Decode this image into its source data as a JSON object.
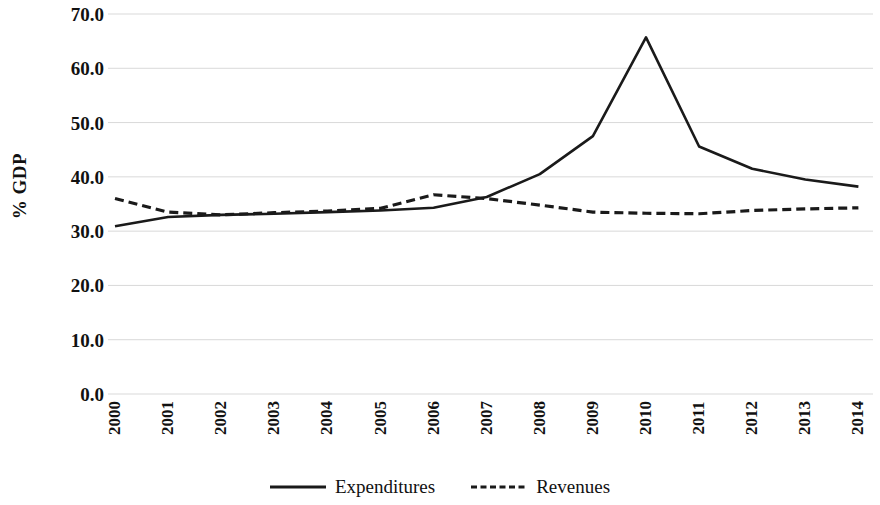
{
  "chart_data": {
    "type": "line",
    "title": "",
    "xlabel": "",
    "ylabel": "% GDP",
    "categories": [
      "2000",
      "2001",
      "2002",
      "2003",
      "2004",
      "2005",
      "2006",
      "2007",
      "2008",
      "2009",
      "2010",
      "2011",
      "2012",
      "2013",
      "2014"
    ],
    "series": [
      {
        "name": "Expenditures",
        "style": "solid",
        "color": "#1a1a1a",
        "values": [
          30.9,
          32.6,
          33.0,
          33.2,
          33.5,
          33.8,
          34.3,
          36.3,
          40.5,
          47.5,
          65.7,
          45.6,
          41.5,
          39.5,
          38.2
        ]
      },
      {
        "name": "Revenues",
        "style": "dashed",
        "color": "#1a1a1a",
        "values": [
          36.0,
          33.5,
          33.0,
          33.4,
          33.7,
          34.2,
          36.7,
          36.0,
          34.8,
          33.5,
          33.3,
          33.2,
          33.8,
          34.1,
          34.3
        ]
      }
    ],
    "ylim": [
      0,
      70
    ],
    "ytick_values": [
      70.0,
      60.0,
      50.0,
      40.0,
      30.0,
      20.0,
      10.0,
      0.0
    ],
    "ytick_labels": [
      "70.0",
      "60.0",
      "50.0",
      "40.0",
      "30.0",
      "20.0",
      "10.0",
      "0.0"
    ],
    "grid": true,
    "grid_axis": "y",
    "grid_color": "#d9d9d9",
    "legend_position": "bottom",
    "background": "#ffffff"
  }
}
